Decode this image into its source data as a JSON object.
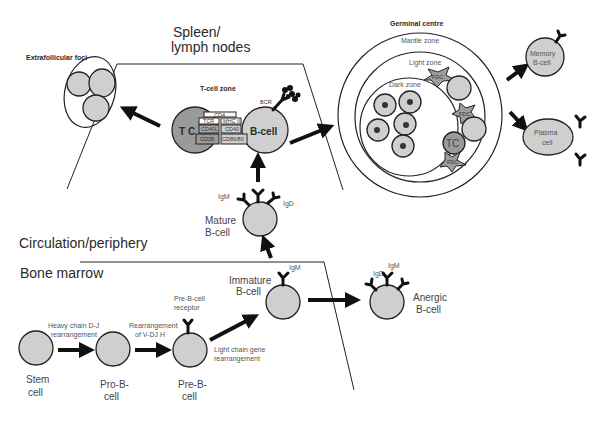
{
  "regions": {
    "spleen": "Spleen/",
    "spleen_line2": "lymph nodes",
    "circulation": "Circulation/periphery",
    "bone_marrow": "Bone marrow"
  },
  "extrafollicular": {
    "title": "Extrafollicular foci"
  },
  "tcell_zone": {
    "title": "T-cell zone",
    "tc_label": "T C",
    "bcell_label": "B-cell",
    "bcr_label": "BCR",
    "molecules": [
      "CD4",
      "TCR",
      "MHC II",
      "CD40L",
      "CD40",
      "CD28",
      "CD86/80"
    ]
  },
  "germinal_centre": {
    "title": "Germinal centre",
    "mantle": "Mantle zone",
    "light": "Light zone",
    "dark": "Dark zone",
    "fdc": "FDC",
    "tc": "TC"
  },
  "outputs": {
    "memory": "Memory",
    "memory_line2": "B-cell",
    "plasma": "Plasma",
    "plasma_line2": "cell"
  },
  "mature": {
    "label": "Mature",
    "label2": "B-cell",
    "igm": "IgM",
    "igd": "IgD"
  },
  "immature": {
    "label": "Immature",
    "label2": "B-cell",
    "igm": "IgM"
  },
  "anergic": {
    "label": "Anergic",
    "label2": "B-cell",
    "igm": "IgM",
    "igd": "IgD"
  },
  "development": {
    "stem": "Stem",
    "stem2": "cell",
    "prob": "Pro-B-",
    "prob2": "cell",
    "preb": "Pre-B-",
    "preb2": "cell",
    "step1": "Heavy chain D-J",
    "step1b": "rearrangement",
    "step2": "Rearrangement",
    "step2b": "of V-DJ H",
    "prebcr": "Pre-B-cell",
    "prebcr2": "receptor",
    "step3": "Light chain gene",
    "step3b": "rearrangement"
  }
}
